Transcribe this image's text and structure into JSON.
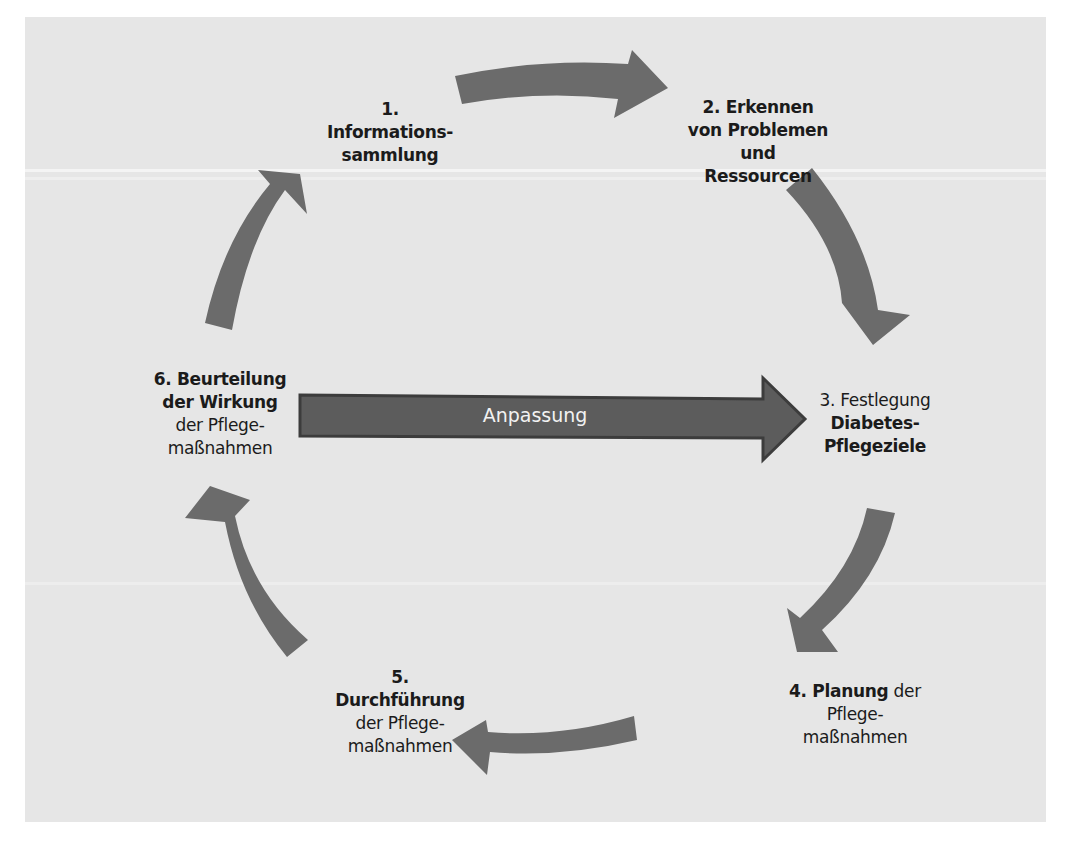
{
  "diagram": {
    "center_arrow": {
      "label": "Anpassung",
      "direction": "right",
      "color": "#5a5a5a"
    },
    "arrow_color": "#6b6b6b",
    "background_color": "#e6e6e6",
    "steps": [
      {
        "number": "1.",
        "lines": [
          {
            "text": "1.",
            "bold": true
          },
          {
            "text": "Informations-",
            "bold": true
          },
          {
            "text": "sammlung",
            "bold": true
          }
        ]
      },
      {
        "number": "2.",
        "lines": [
          {
            "text": "2. Erkennen",
            "bold": true
          },
          {
            "text": "von Problemen",
            "bold": true
          },
          {
            "text": "und",
            "bold": true
          },
          {
            "text": "Ressourcen",
            "bold": true
          }
        ]
      },
      {
        "number": "3.",
        "lines": [
          {
            "text": "3. Festlegung",
            "bold": false
          },
          {
            "text": "Diabetes-",
            "bold": true
          },
          {
            "text": "Pflegeziele",
            "bold": true
          }
        ]
      },
      {
        "number": "4.",
        "lines": [
          {
            "text_bold": "4. Planung",
            "text_normal": " der"
          },
          {
            "text": "Pflege-",
            "bold": false
          },
          {
            "text": "maßnahmen",
            "bold": false
          }
        ]
      },
      {
        "number": "5.",
        "lines": [
          {
            "text": "5.",
            "bold": true
          },
          {
            "text": "Durchführung",
            "bold": true
          },
          {
            "text": "der Pflege-",
            "bold": false
          },
          {
            "text": "maßnahmen",
            "bold": false
          }
        ]
      },
      {
        "number": "6.",
        "lines": [
          {
            "text": "6. Beurteilung",
            "bold": true
          },
          {
            "text": "der Wirkung",
            "bold": true
          },
          {
            "text": "der Pflege-",
            "bold": false
          },
          {
            "text": "maßnahmen",
            "bold": false
          }
        ]
      }
    ],
    "cycle_arrows": [
      {
        "from": "1",
        "to": "2"
      },
      {
        "from": "2",
        "to": "3"
      },
      {
        "from": "3",
        "to": "4"
      },
      {
        "from": "4",
        "to": "5"
      },
      {
        "from": "5",
        "to": "6"
      },
      {
        "from": "6",
        "to": "1"
      }
    ]
  }
}
